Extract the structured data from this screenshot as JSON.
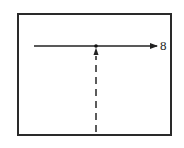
{
  "diagram": {
    "frame": {
      "x": 17,
      "y": 13,
      "width": 155,
      "height": 123,
      "stroke": "#2a2a2a"
    },
    "horizontal_arrow": {
      "x1": 34,
      "y1": 46,
      "x2": 158,
      "y2": 46,
      "color": "#222222",
      "label": "8"
    },
    "junction_point": {
      "x": 96,
      "y": 46
    },
    "dashed_arrow": {
      "x": 96,
      "y_start": 132,
      "y_end": 49,
      "style": "dashed",
      "color": "#333333"
    }
  }
}
